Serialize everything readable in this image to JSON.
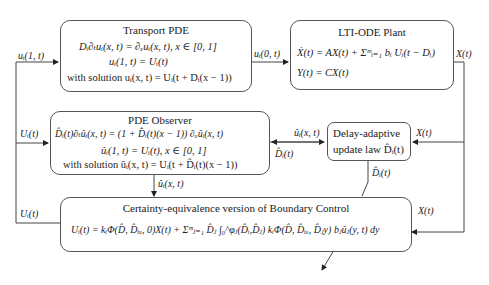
{
  "blocks": {
    "transport_pde": {
      "title": "Transport PDE",
      "eq1": "Dᵢ∂ₜuᵢ(x, t) = ∂ₓuᵢ(x, t), x ∈ [0, 1]",
      "eq2": "uᵢ(1, t) = Uᵢ(t)",
      "eq3": "with solution  uᵢ(x, t) = Uᵢ(t + Dᵢ(x − 1))"
    },
    "lti_ode_plant": {
      "title": "LTI-ODE Plant",
      "eq1": "Ẋ(t) = AX(t) + Σᵐᵢ₌₁ bᵢ Uᵢ(t − Dᵢ)",
      "eq2": "Y(t) = CX(t)"
    },
    "pde_observer": {
      "title": "PDE Observer",
      "eq1": "D̂ᵢ(t)∂ₜûᵢ(x, t) = (1 + D̂̇ᵢ(t)(x − 1)) ∂ₓûᵢ(x, t)",
      "eq2": "ûᵢ(1, t) = Uᵢ(t), x ∈ [0, 1]",
      "eq3": "with solution  ûᵢ(x, t) = Uᵢ(t + D̂ᵢ(t)(x − 1))"
    },
    "delay_adaptive": {
      "line1": "Delay-adaptive",
      "line2": "update law D̂ᵢ(t)"
    },
    "boundary_control": {
      "title": "Certainty-equivalence version of Boundary Control",
      "eq1": "Uᵢ(t) = kᵢΦ(D̂, D̂ᵢᵤ, 0)X(t) + Σᵐⱼ₌₁ D̂ⱼ ∫₀^φⱼ(D̂ᵢ,D̂ⱼ) kᵢΦ(D̂, D̂ᵢᵤ, D̂ⱼy) bⱼûⱼ(y, t) dy"
    }
  },
  "signals": {
    "u_1t": "uᵢ(1, t)",
    "u_0t": "uᵢ(0, t)",
    "X_plant_out": "X(t)",
    "U_obs_in": "Uᵢ(t)",
    "u_hat_to_update": "ûᵢ(x, t)",
    "D_hat_to_obs": "D̂ᵢ(t)",
    "X_to_update": "X(t)",
    "u_hat_down": "ûᵢ(x, t)",
    "D_hat_down": "D̂ᵢ(t)",
    "U_control_out": "Uᵢ(t)",
    "X_to_control": "X(t)"
  }
}
